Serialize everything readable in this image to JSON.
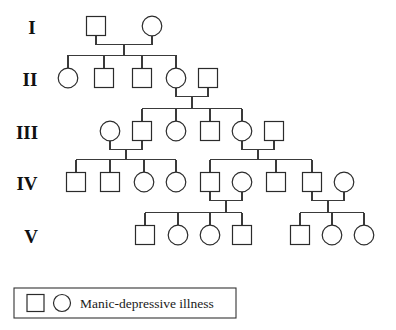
{
  "figure": {
    "type": "pedigree-chart",
    "title": "",
    "generation_labels": [
      "I",
      "II",
      "III",
      "IV",
      "V"
    ],
    "legend": {
      "label": "Manic-depressive illness",
      "square_symbol": "striped-square",
      "circle_symbol": "striped-circle",
      "affected_fill": "vertical-stripes"
    },
    "symbol_key": {
      "square": "male",
      "circle": "female",
      "striped": "affected",
      "empty": "unaffected"
    },
    "colors": {
      "background": "#ffffff",
      "stroke": "#2b2b2b",
      "line": "#3a3a3a",
      "text": "#111111"
    }
  },
  "generations": [
    {
      "id": "I",
      "label": "I",
      "label_x": 32,
      "label_y": 34,
      "y": 26,
      "individuals": [
        {
          "id": "I-1",
          "sex": "male",
          "shape": "square",
          "affected": true,
          "x": 96,
          "y": 26
        },
        {
          "id": "I-2",
          "sex": "female",
          "shape": "circle",
          "affected": false,
          "x": 152,
          "y": 26
        }
      ]
    },
    {
      "id": "II",
      "label": "II",
      "label_x": 30,
      "label_y": 86,
      "y": 78,
      "individuals": [
        {
          "id": "II-1",
          "sex": "female",
          "shape": "circle",
          "affected": true,
          "x": 68,
          "y": 78
        },
        {
          "id": "II-2",
          "sex": "male",
          "shape": "square",
          "affected": false,
          "x": 104,
          "y": 78
        },
        {
          "id": "II-3",
          "sex": "male",
          "shape": "square",
          "affected": false,
          "x": 142,
          "y": 78
        },
        {
          "id": "II-4",
          "sex": "female",
          "shape": "circle",
          "affected": true,
          "x": 176,
          "y": 78
        },
        {
          "id": "II-5",
          "sex": "male",
          "shape": "square",
          "affected": false,
          "x": 208,
          "y": 78
        }
      ]
    },
    {
      "id": "III",
      "label": "III",
      "label_x": 27,
      "label_y": 139,
      "y": 131,
      "individuals": [
        {
          "id": "III-1",
          "sex": "female",
          "shape": "circle",
          "affected": false,
          "x": 110,
          "y": 131
        },
        {
          "id": "III-2",
          "sex": "male",
          "shape": "square",
          "affected": true,
          "x": 142,
          "y": 131
        },
        {
          "id": "III-3",
          "sex": "female",
          "shape": "circle",
          "affected": false,
          "x": 176,
          "y": 131
        },
        {
          "id": "III-4",
          "sex": "male",
          "shape": "square",
          "affected": false,
          "x": 210,
          "y": 131
        },
        {
          "id": "III-5",
          "sex": "female",
          "shape": "circle",
          "affected": true,
          "x": 242,
          "y": 131
        },
        {
          "id": "III-6",
          "sex": "male",
          "shape": "square",
          "affected": false,
          "x": 274,
          "y": 131
        }
      ]
    },
    {
      "id": "IV",
      "label": "IV",
      "label_x": 27,
      "label_y": 190,
      "y": 182,
      "individuals": [
        {
          "id": "IV-1",
          "sex": "male",
          "shape": "square",
          "affected": false,
          "x": 76,
          "y": 182
        },
        {
          "id": "IV-2",
          "sex": "male",
          "shape": "square",
          "affected": false,
          "x": 110,
          "y": 182
        },
        {
          "id": "IV-3",
          "sex": "female",
          "shape": "circle",
          "affected": true,
          "x": 144,
          "y": 182
        },
        {
          "id": "IV-4",
          "sex": "female",
          "shape": "circle",
          "affected": true,
          "x": 176,
          "y": 182
        },
        {
          "id": "IV-5",
          "sex": "male",
          "shape": "square",
          "affected": false,
          "x": 210,
          "y": 182
        },
        {
          "id": "IV-6",
          "sex": "female",
          "shape": "circle",
          "affected": true,
          "x": 242,
          "y": 182
        },
        {
          "id": "IV-7",
          "sex": "male",
          "shape": "square",
          "affected": false,
          "x": 276,
          "y": 182
        },
        {
          "id": "IV-8",
          "sex": "male",
          "shape": "square",
          "affected": true,
          "x": 312,
          "y": 182
        },
        {
          "id": "IV-9",
          "sex": "female",
          "shape": "circle",
          "affected": false,
          "x": 344,
          "y": 182
        }
      ]
    },
    {
      "id": "V",
      "label": "V",
      "label_x": 31,
      "label_y": 243,
      "y": 235,
      "individuals": [
        {
          "id": "V-1",
          "sex": "male",
          "shape": "square",
          "affected": true,
          "x": 145,
          "y": 235
        },
        {
          "id": "V-2",
          "sex": "female",
          "shape": "circle",
          "affected": false,
          "x": 178,
          "y": 235
        },
        {
          "id": "V-3",
          "sex": "female",
          "shape": "circle",
          "affected": true,
          "x": 210,
          "y": 235
        },
        {
          "id": "V-4",
          "sex": "male",
          "shape": "square",
          "affected": false,
          "x": 242,
          "y": 235
        },
        {
          "id": "V-5",
          "sex": "male",
          "shape": "square",
          "affected": false,
          "x": 300,
          "y": 235
        },
        {
          "id": "V-6",
          "sex": "female",
          "shape": "circle",
          "affected": true,
          "x": 332,
          "y": 235
        },
        {
          "id": "V-7",
          "sex": "female",
          "shape": "circle",
          "affected": true,
          "x": 364,
          "y": 235
        }
      ]
    }
  ],
  "matings": [
    {
      "id": "mating-I",
      "partners": [
        "I-1",
        "I-2"
      ],
      "mid_x": 124,
      "children": [
        "II-1",
        "II-2",
        "II-3",
        "II-4"
      ]
    },
    {
      "id": "mating-II",
      "partners": [
        "II-4",
        "II-5"
      ],
      "mid_x": 192,
      "children": [
        "III-2",
        "III-3",
        "III-4",
        "III-5"
      ]
    },
    {
      "id": "mating-III-a",
      "partners": [
        "III-1",
        "III-2"
      ],
      "mid_x": 126,
      "children": [
        "IV-1",
        "IV-2",
        "IV-3",
        "IV-4"
      ]
    },
    {
      "id": "mating-III-b",
      "partners": [
        "III-5",
        "III-6"
      ],
      "mid_x": 258,
      "children": [
        "IV-5",
        "IV-7",
        "IV-8"
      ]
    },
    {
      "id": "mating-IV-a",
      "partners": [
        "IV-5",
        "IV-6"
      ],
      "mid_x": 226,
      "children": [
        "V-1",
        "V-2",
        "V-3",
        "V-4"
      ]
    },
    {
      "id": "mating-IV-b",
      "partners": [
        "IV-8",
        "IV-9"
      ],
      "mid_x": 328,
      "children": [
        "V-5",
        "V-6",
        "V-7"
      ]
    }
  ],
  "legend_box": {
    "x": 14,
    "y": 288,
    "width": 222,
    "height": 30
  }
}
